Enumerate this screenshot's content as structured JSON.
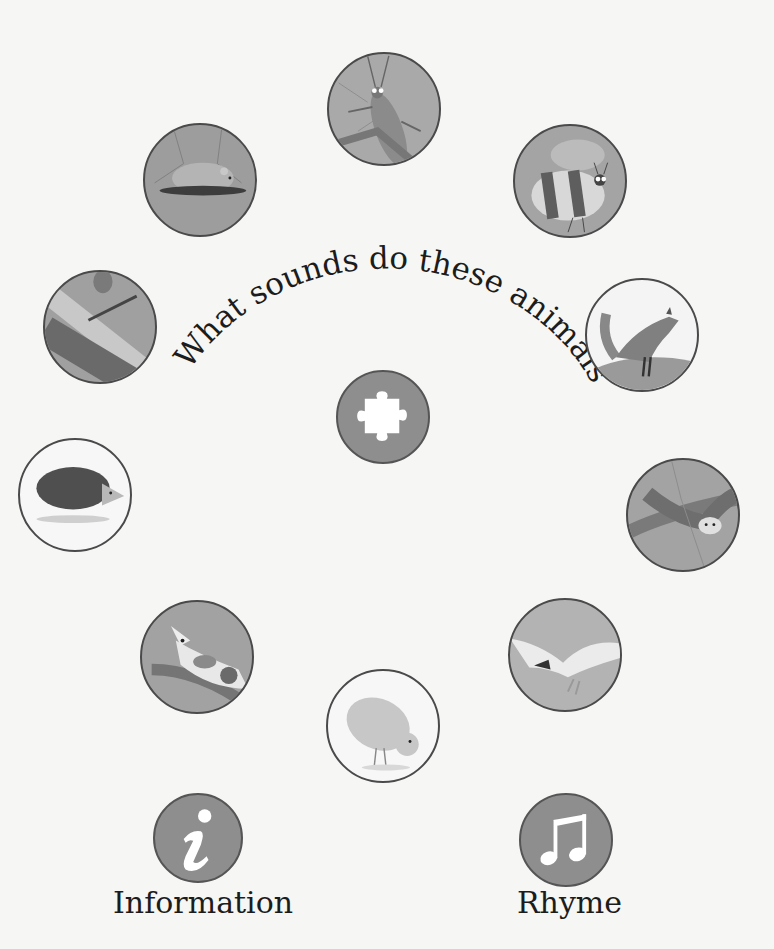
{
  "title": "What sounds do these animals make?",
  "animals": [
    {
      "id": "grasshopper",
      "name": "Grasshopper",
      "cx": 384,
      "cy": 109,
      "r": 57,
      "bg": "#a9a9a9"
    },
    {
      "id": "mouse",
      "name": "Mouse",
      "cx": 200,
      "cy": 180,
      "r": 57,
      "bg": "#9d9d9d"
    },
    {
      "id": "bee",
      "name": "Bee",
      "cx": 570,
      "cy": 181,
      "r": 57,
      "bg": "#a4a4a4"
    },
    {
      "id": "frog",
      "name": "Frog",
      "cx": 100,
      "cy": 327,
      "r": 57,
      "bg": "#a0a0a0"
    },
    {
      "id": "fox",
      "name": "Fox",
      "cx": 642,
      "cy": 335,
      "r": 57,
      "bg": "#f4f4f4"
    },
    {
      "id": "hedgehog",
      "name": "Hedgehog",
      "cx": 75,
      "cy": 495,
      "r": 57,
      "bg": "#f7f7f7"
    },
    {
      "id": "owl",
      "name": "Owl",
      "cx": 683,
      "cy": 515,
      "r": 57,
      "bg": "#a3a3a3"
    },
    {
      "id": "dog",
      "name": "Dog",
      "cx": 197,
      "cy": 657,
      "r": 57,
      "bg": "#a2a2a2"
    },
    {
      "id": "seagull",
      "name": "Seagull",
      "cx": 565,
      "cy": 655,
      "r": 57,
      "bg": "#b3b3b3"
    },
    {
      "id": "chick",
      "name": "Chick",
      "cx": 383,
      "cy": 726,
      "r": 57,
      "bg": "#f7f7f7"
    }
  ],
  "puzzle": {
    "icon": "puzzle-piece-icon",
    "cx": 383,
    "cy": 417,
    "r": 47
  },
  "information": {
    "label": "Information",
    "icon": "info-icon",
    "cx": 198,
    "cy": 838,
    "r": 45
  },
  "rhyme": {
    "label": "Rhyme",
    "icon": "music-note-icon",
    "cx": 566,
    "cy": 840,
    "r": 47
  },
  "colors": {
    "button_fill": "#8e8e8e",
    "border": "#4a4a4a",
    "background": "#f6f6f5",
    "text": "#1c1c1c"
  }
}
